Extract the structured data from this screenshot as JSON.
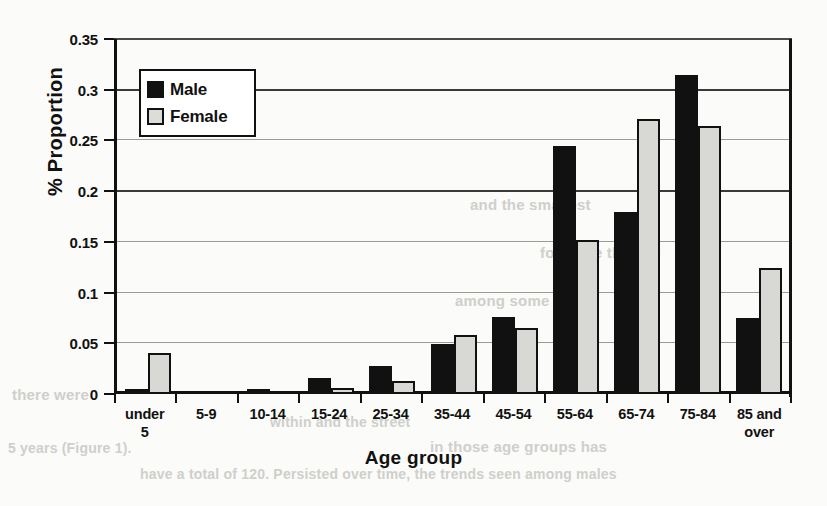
{
  "chart_data": {
    "type": "bar",
    "title": "",
    "xlabel": "Age group",
    "ylabel": "% Proportion",
    "ylim": [
      0,
      0.35
    ],
    "ytick_labels": [
      "0.35",
      "0.3",
      "0.25",
      "0.2",
      "0.15",
      "0.1",
      "0.05",
      "0"
    ],
    "ytick_values": [
      0.35,
      0.3,
      0.25,
      0.2,
      0.15,
      0.1,
      0.05,
      0
    ],
    "grid": true,
    "legend_position": "upper-left-inside",
    "categories": [
      "under 5",
      "5-9",
      "10-14",
      "15-24",
      "25-34",
      "35-44",
      "45-54",
      "55-64",
      "65-74",
      "75-84",
      "85 and over"
    ],
    "category_lines": [
      [
        "under",
        "5"
      ],
      [
        "5-9",
        ""
      ],
      [
        "10-14",
        ""
      ],
      [
        "15-24",
        ""
      ],
      [
        "25-34",
        ""
      ],
      [
        "35-44",
        ""
      ],
      [
        "45-54",
        ""
      ],
      [
        "55-64",
        ""
      ],
      [
        "65-74",
        ""
      ],
      [
        "75-84",
        ""
      ],
      [
        "85 and",
        "over"
      ]
    ],
    "series": [
      {
        "name": "Male",
        "color": "#111111",
        "values": [
          0.005,
          0.0,
          0.005,
          0.016,
          0.028,
          0.049,
          0.076,
          0.245,
          0.179,
          0.315,
          0.075
        ]
      },
      {
        "name": "Female",
        "color": "#d8d8d4",
        "values": [
          0.04,
          0.0,
          0.0,
          0.006,
          0.013,
          0.058,
          0.065,
          0.152,
          0.271,
          0.264,
          0.124
        ]
      }
    ]
  },
  "legend": {
    "items": [
      {
        "label": "Male"
      },
      {
        "label": "Female"
      }
    ]
  },
  "background_bleed": [
    {
      "text": "and the smallest",
      "x": 470,
      "y": 196,
      "size": 15
    },
    {
      "text": "for more than 20",
      "x": 540,
      "y": 244,
      "size": 15
    },
    {
      "text": "among some",
      "x": 455,
      "y": 292,
      "size": 15
    },
    {
      "text": "there were",
      "x": 12,
      "y": 386,
      "size": 15
    },
    {
      "text": "within and the street",
      "x": 270,
      "y": 414,
      "size": 14
    },
    {
      "text": "in those age groups has",
      "x": 430,
      "y": 438,
      "size": 15
    },
    {
      "text": "have a total of 120.   Persisted over time, the trends seen among males",
      "x": 140,
      "y": 466,
      "size": 14
    },
    {
      "text": "5 years (Figure 1).",
      "x": 8,
      "y": 440,
      "size": 14
    }
  ]
}
